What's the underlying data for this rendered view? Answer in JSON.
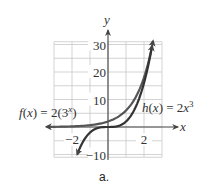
{
  "chart_data": {
    "type": "line",
    "title": "",
    "xlabel": "x",
    "ylabel": "y",
    "xlim": [
      -3,
      3
    ],
    "ylim": [
      -11,
      31
    ],
    "grid": true,
    "x_ticks": [
      {
        "value": -2,
        "label": "−2"
      },
      {
        "value": 2,
        "label": "2"
      }
    ],
    "y_ticks": [
      {
        "value": 30,
        "label": "30"
      },
      {
        "value": 20,
        "label": "20"
      },
      {
        "value": 10,
        "label": "10"
      },
      {
        "value": -10,
        "label": "−10"
      }
    ],
    "x_grid_step": 1,
    "y_grid_step": 5,
    "series": [
      {
        "name": "f(x) = 2(3^x)",
        "label_parts": {
          "fname": "f(x) = 2(3",
          "sup": "x",
          "close": ")"
        },
        "expression": "2*3^x",
        "x": [
          -3.4,
          -3,
          -2,
          -1,
          0,
          1,
          2,
          2.5
        ],
        "values": [
          0.05,
          0.07,
          0.22,
          0.67,
          2,
          6,
          18,
          31.2
        ],
        "color": "#555555",
        "arrows": "both"
      },
      {
        "name": "h(x) = 2x^3",
        "label_parts": {
          "fname": "h(x) = 2x",
          "sup": "3",
          "close": ""
        },
        "expression": "2*x^3",
        "x": [
          -1.7,
          -1,
          0,
          1,
          2,
          2.45
        ],
        "values": [
          -9.8,
          -2,
          0,
          2,
          16,
          29.4
        ],
        "color": "#333333",
        "arrows": "both"
      }
    ]
  },
  "caption": "a."
}
